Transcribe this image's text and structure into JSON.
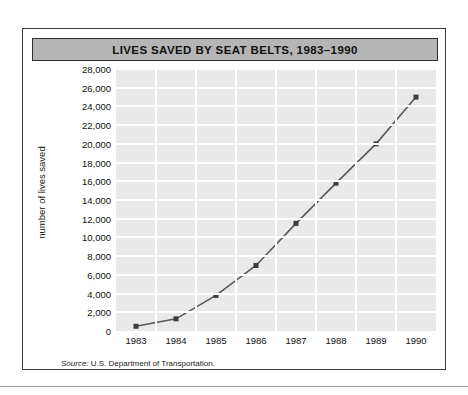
{
  "figure": {
    "title": "LIVES SAVED BY SEAT BELTS, 1983–1990",
    "source_label": "Source:",
    "source_text": "U.S. Department of Transportation.",
    "colors": {
      "title_bar_fill": "#b5b5b5",
      "frame_border": "#3a3a3a",
      "plot_background": "#e9e9e9",
      "gridline": "#ffffff",
      "series_line": "#5a5a5a",
      "marker": "#3c3c3c"
    }
  },
  "chart_data": {
    "type": "line",
    "title": "LIVES SAVED BY SEAT BELTS, 1983–1990",
    "xlabel": "",
    "ylabel": "number of lives saved",
    "categories": [
      "1983",
      "1984",
      "1985",
      "1986",
      "1987",
      "1988",
      "1989",
      "1990"
    ],
    "x": [
      1983,
      1984,
      1985,
      1986,
      1987,
      1988,
      1989,
      1990
    ],
    "values": [
      500,
      1300,
      3800,
      7000,
      11500,
      15800,
      20000,
      25000
    ],
    "ylim": [
      0,
      28000
    ],
    "yticks": [
      0,
      2000,
      4000,
      6000,
      8000,
      10000,
      12000,
      14000,
      16000,
      18000,
      20000,
      22000,
      24000,
      26000,
      28000
    ],
    "ytick_labels": [
      "0",
      "2,000",
      "4,000",
      "6,000",
      "8,000",
      "10,000",
      "12,000",
      "14,000",
      "16,000",
      "18,000",
      "20,000",
      "22,000",
      "24,000",
      "26,000",
      "28,000"
    ],
    "grid": true,
    "legend": false,
    "markers": "square"
  }
}
